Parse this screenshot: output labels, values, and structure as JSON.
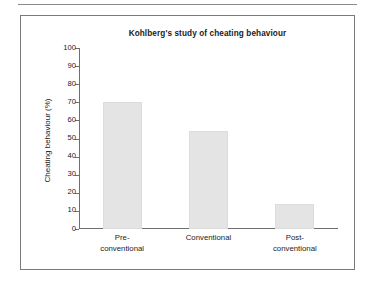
{
  "chart_data": {
    "type": "bar",
    "title": "Kohlberg's study of cheating behaviour",
    "xlabel": "",
    "ylabel": "Cheating behaviour (%)",
    "categories": [
      "Pre-conventional",
      "Conventional",
      "Post-conventional"
    ],
    "category_lines": [
      [
        "Pre-",
        "conventional"
      ],
      [
        "Conventional"
      ],
      [
        "Post-",
        "conventional"
      ]
    ],
    "values": [
      70,
      54,
      14
    ],
    "ylim": [
      0,
      100
    ],
    "yticks": [
      0,
      10,
      20,
      30,
      40,
      50,
      60,
      70,
      80,
      90,
      100
    ],
    "ytick_labels": [
      "0",
      "10",
      "20",
      "30",
      "40",
      "50",
      "60",
      "70",
      "80",
      "90",
      "100"
    ],
    "grid": false,
    "legend": null,
    "bar_color": "#e4e4e4",
    "axis_color": "#6f6f6f",
    "text_color": "#1b1b1b"
  },
  "figure": {
    "border_color": "#7a7a7a",
    "background": "#ffffff",
    "rule_color": "#8a8a8a"
  }
}
